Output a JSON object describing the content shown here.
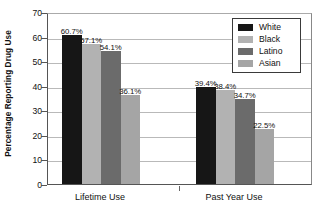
{
  "chart_data": {
    "type": "bar",
    "title": "",
    "xlabel": "",
    "ylabel": "Percentage Reporting Drug Use",
    "ylim": [
      0,
      70
    ],
    "yticks": [
      0,
      10,
      20,
      30,
      40,
      50,
      60,
      70
    ],
    "ytick_labels": [
      "0",
      "10",
      "20",
      "30",
      "40",
      "50",
      "60",
      "70"
    ],
    "grid": true,
    "legend_position": "top-right",
    "categories": [
      "Lifetime Use",
      "Past Year Use"
    ],
    "series": [
      {
        "name": "White",
        "color": "#161616",
        "values": [
          60.7,
          39.4
        ],
        "labels": [
          "60.7%",
          "39.4%"
        ]
      },
      {
        "name": "Black",
        "color": "#b2b2b2",
        "values": [
          57.1,
          38.4
        ],
        "labels": [
          "57.1%",
          "38.4%"
        ]
      },
      {
        "name": "Latino",
        "color": "#6b6b6b",
        "values": [
          54.1,
          34.7
        ],
        "labels": [
          "54.1%",
          "34.7%"
        ]
      },
      {
        "name": "Asian",
        "color": "#a5a5a5",
        "values": [
          36.1,
          22.5
        ],
        "labels": [
          "36.1%",
          "22.5%"
        ]
      }
    ]
  },
  "legend": {
    "items": [
      {
        "label": "White",
        "color": "#161616"
      },
      {
        "label": "Black",
        "color": "#b2b2b2"
      },
      {
        "label": "Latino",
        "color": "#6b6b6b"
      },
      {
        "label": "Asian",
        "color": "#a5a5a5"
      }
    ]
  }
}
